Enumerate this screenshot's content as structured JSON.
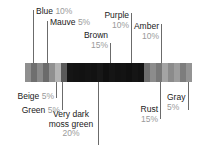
{
  "chart_data": {
    "type": "bar",
    "orientation": "horizontal-stacked",
    "title": "",
    "xlabel": "",
    "ylabel": "",
    "unit": "percent",
    "total": 100,
    "categories": [
      "Beige",
      "Blue",
      "Green",
      "Mauve",
      "Very dark moss green",
      "Brown",
      "Purple",
      "Rust",
      "Amber",
      "Gray"
    ],
    "values": [
      5,
      10,
      5,
      5,
      20,
      15,
      10,
      15,
      10,
      5
    ],
    "labels": [
      {
        "name": "Beige",
        "pct": "5%"
      },
      {
        "name": "Blue",
        "pct": "10%"
      },
      {
        "name": "Green",
        "pct": "5%"
      },
      {
        "name": "Mauve",
        "pct": "5%"
      },
      {
        "name": "Very dark moss green",
        "pct": "20%"
      },
      {
        "name": "Brown",
        "pct": "15%"
      },
      {
        "name": "Purple",
        "pct": "10%"
      },
      {
        "name": "Rust",
        "pct": "15%"
      },
      {
        "name": "Amber",
        "pct": "10%"
      },
      {
        "name": "Gray",
        "pct": "5%"
      }
    ],
    "segments": [
      {
        "color": "#8f8f8f"
      },
      {
        "color": "#6f6f6f"
      },
      {
        "color": "#8a8a8a"
      },
      {
        "color": "#6b6b6b"
      },
      {
        "color": "#909090"
      },
      {
        "color": "#b4b4b4"
      },
      {
        "color": "#5a5a5a"
      },
      {
        "color": "#151515"
      },
      {
        "color": "#131313"
      },
      {
        "color": "#121212"
      },
      {
        "color": "#141414"
      },
      {
        "color": "#121212"
      },
      {
        "color": "#171717"
      },
      {
        "color": "#101010"
      },
      {
        "color": "#151515"
      },
      {
        "color": "#121212"
      },
      {
        "color": "#131313"
      },
      {
        "color": "#101010"
      },
      {
        "color": "#151515"
      },
      {
        "color": "#121212"
      },
      {
        "color": "#6e6e6e"
      },
      {
        "color": "#8c8c8c"
      },
      {
        "color": "#787878"
      },
      {
        "color": "#a4a4a4"
      },
      {
        "color": "#8b8b8b"
      },
      {
        "color": "#9d9d9d"
      },
      {
        "color": "#7d7d7d"
      },
      {
        "color": "#949494"
      }
    ],
    "grid": false,
    "legend": "callout-leader-lines"
  },
  "callouts": {
    "blue": {
      "name": "Blue",
      "pct": "10%"
    },
    "mauve": {
      "name": "Mauve",
      "pct": "5%"
    },
    "brown": {
      "name": "Brown",
      "pct": "15%"
    },
    "purple": {
      "name": "Purple",
      "pct": "10%"
    },
    "amber": {
      "name": "Amber",
      "pct": "10%"
    },
    "beige": {
      "name": "Beige",
      "pct": "5%"
    },
    "green": {
      "name": "Green",
      "pct": "5%"
    },
    "moss": {
      "name": "Very dark moss green",
      "pct": "20%"
    },
    "rust": {
      "name": "Rust",
      "pct": "15%"
    },
    "gray": {
      "name": "Gray",
      "pct": "5%"
    }
  },
  "colors": {
    "leader_line": "#6b6b6b",
    "label_text": "#1a1a1a",
    "pct_text": "#9a9a9a",
    "background": "#ffffff"
  }
}
